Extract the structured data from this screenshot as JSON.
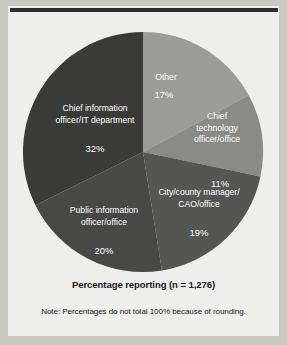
{
  "chart_data": {
    "type": "pie",
    "title": "",
    "caption": "Percentage reporting (n = 1,276)",
    "note": "Note: Percentages do not total 100% because of rounding.",
    "legend": "none",
    "labels_position": "inside-slice",
    "start_angle_deg": 0,
    "direction": "clockwise",
    "total_percent": 99,
    "categories": [
      "Other",
      "Chief technology officer/office",
      "City/county manager/CAO/office",
      "Public information officer/office",
      "Chief information officer/IT department"
    ],
    "values": [
      17,
      11,
      19,
      20,
      32
    ],
    "value_labels": [
      "17%",
      "11%",
      "19%",
      "20%",
      "32%"
    ],
    "slices": [
      {
        "name": "Other",
        "value": 17,
        "value_label": "17%",
        "color": "#9b9b99",
        "label_lines": [
          "Other"
        ],
        "label_x": 166,
        "label_y": 78,
        "value_x": 164,
        "value_y": 96
      },
      {
        "name": "Chief technology officer/office",
        "value": 11,
        "value_label": "11%",
        "color": "#8a8a87",
        "label_lines": [
          "Chief",
          "technology",
          "officer/office"
        ],
        "label_x": 217,
        "label_y": 117,
        "value_x": 220,
        "value_y": 162
      },
      {
        "name": "City/county manager/CAO/office",
        "value": 19,
        "value_label": "19%",
        "color": "#555553",
        "label_lines": [
          "City/county manager/",
          "CAO/office"
        ],
        "label_x": 199,
        "label_y": 193,
        "value_x": 199,
        "value_y": 222
      },
      {
        "name": "Public information officer/office",
        "value": 20,
        "value_label": "20%",
        "color": "#484846",
        "label_lines": [
          "Public information",
          "officer/office"
        ],
        "label_x": 104,
        "label_y": 211,
        "value_x": 104,
        "value_y": 240
      },
      {
        "name": "Chief information officer/IT department",
        "value": 32,
        "value_label": "32%",
        "color": "#3a3a38",
        "label_lines": [
          "Chief information",
          "officer/IT department"
        ],
        "label_x": 95,
        "label_y": 109,
        "value_x": 95,
        "value_y": 138
      }
    ],
    "geometry": {
      "center_x": 143,
      "center_y": 152,
      "radius": 120
    },
    "colors": {
      "page_background": "#c9c9c4",
      "card_background": "#eeeeec",
      "rule": "#2e2e2e",
      "label_text": "#ffffff",
      "caption_text": "#1d1d1d"
    }
  }
}
